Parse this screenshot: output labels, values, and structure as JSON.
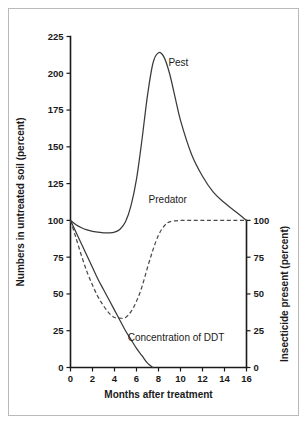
{
  "chart_data": {
    "type": "line",
    "title": "",
    "xlabel": "Months after treatment",
    "ylabel": "Numbers in untreated soil (percent)",
    "y2label": "Insecticide present (percent)",
    "xlim": [
      0,
      16
    ],
    "ylim": [
      0,
      225
    ],
    "y2lim": [
      0,
      100
    ],
    "xticks": [
      0,
      2,
      4,
      6,
      8,
      10,
      12,
      14,
      16
    ],
    "yticks": [
      0,
      25,
      50,
      75,
      100,
      125,
      150,
      175,
      200,
      225
    ],
    "y2ticks": [
      0,
      25,
      50,
      75,
      100
    ],
    "grid": false,
    "legend_position": "inline-annotations",
    "series": [
      {
        "name": "Pest",
        "axis": "left",
        "style": "solid",
        "label_text": "Pest",
        "x": [
          0,
          0.5,
          1,
          1.5,
          2,
          2.5,
          3,
          3.5,
          4,
          4.5,
          5,
          5.5,
          6,
          6.5,
          7,
          7.5,
          8,
          8.5,
          9,
          9.5,
          10,
          11,
          12,
          13,
          14,
          15,
          16
        ],
        "values": [
          100,
          97,
          95,
          93.5,
          92.5,
          92,
          91.5,
          91.5,
          92,
          94,
          99,
          110,
          128,
          155,
          185,
          207,
          214,
          211,
          200,
          184,
          168,
          145,
          130,
          119,
          112,
          106,
          100
        ]
      },
      {
        "name": "Predator",
        "axis": "left",
        "style": "dashed",
        "label_text": "Predator",
        "x": [
          0,
          0.5,
          1,
          1.5,
          2,
          2.5,
          3,
          3.5,
          4,
          4.5,
          5,
          5.5,
          6,
          6.5,
          7,
          7.5,
          8,
          8.5,
          9,
          10,
          11,
          12,
          13,
          14,
          15,
          16
        ],
        "values": [
          100,
          88,
          76,
          65,
          56,
          48,
          42,
          37,
          34,
          33.5,
          34,
          38,
          45,
          55,
          68,
          80,
          90,
          96,
          99,
          100,
          100,
          100,
          100,
          100,
          100,
          100
        ]
      },
      {
        "name": "Concentration of DDT",
        "axis": "right",
        "style": "solid",
        "label_text": "Concentration of DDT",
        "x": [
          0,
          0.5,
          1,
          1.5,
          2,
          2.5,
          3,
          3.5,
          4,
          4.5,
          5,
          5.5,
          6,
          6.5,
          7,
          7.5
        ],
        "values": [
          100,
          92,
          84,
          76,
          68,
          60,
          53,
          46,
          39,
          32,
          25,
          19,
          13,
          8,
          3,
          0
        ]
      }
    ],
    "annotations": [
      {
        "text": "Pest",
        "x": 8.9,
        "y": 205
      },
      {
        "text": "Predator",
        "x": 7.1,
        "y": 112
      },
      {
        "text": "Concentration of DDT",
        "x": 5.2,
        "y": 18
      }
    ]
  },
  "axes": {
    "y_title": "Numbers in untreated soil (percent)",
    "y2_title": "Insecticide present (percent)",
    "x_title": "Months after treatment",
    "y_tick_labels": [
      "0",
      "25",
      "50",
      "75",
      "100",
      "125",
      "150",
      "175",
      "200",
      "225"
    ],
    "y2_tick_labels": [
      "0",
      "25",
      "50",
      "75",
      "100"
    ],
    "x_tick_labels": [
      "0",
      "2",
      "4",
      "6",
      "8",
      "10",
      "12",
      "14",
      "16"
    ]
  },
  "colors": {
    "curve": "#3a3a3a",
    "axis": "#1a1a1a",
    "frame": "#b9b9b9",
    "background": "#ffffff"
  }
}
